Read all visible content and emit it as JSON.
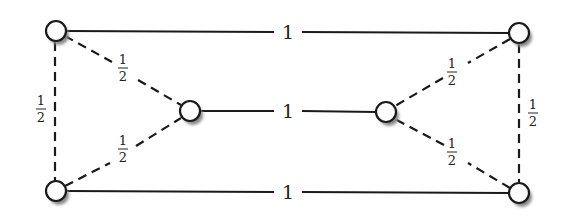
{
  "diagram": {
    "nodes": [
      {
        "id": "top-left",
        "x": 56,
        "y": 31
      },
      {
        "id": "mid-left",
        "x": 190,
        "y": 111
      },
      {
        "id": "bottom-left",
        "x": 56,
        "y": 191
      },
      {
        "id": "mid-right",
        "x": 386,
        "y": 112
      },
      {
        "id": "top-right",
        "x": 519,
        "y": 33
      },
      {
        "id": "bottom-right",
        "x": 519,
        "y": 193
      }
    ],
    "edges": [
      {
        "from": "top-left",
        "to": "top-right",
        "style": "solid",
        "weight": "1"
      },
      {
        "from": "mid-left",
        "to": "mid-right",
        "style": "solid",
        "weight": "1"
      },
      {
        "from": "bottom-left",
        "to": "bottom-right",
        "style": "solid",
        "weight": "1"
      },
      {
        "from": "top-left",
        "to": "mid-left",
        "style": "dashed",
        "weight": "1/2"
      },
      {
        "from": "bottom-left",
        "to": "mid-left",
        "style": "dashed",
        "weight": "1/2"
      },
      {
        "from": "top-left",
        "to": "bottom-left",
        "style": "dashed",
        "weight": "1/2"
      },
      {
        "from": "top-right",
        "to": "mid-right",
        "style": "dashed",
        "weight": "1/2"
      },
      {
        "from": "bottom-right",
        "to": "mid-right",
        "style": "dashed",
        "weight": "1/2"
      },
      {
        "from": "top-right",
        "to": "bottom-right",
        "style": "dashed",
        "weight": "1/2"
      }
    ],
    "labels": {
      "one": "1",
      "num": "1",
      "den": "2"
    }
  }
}
